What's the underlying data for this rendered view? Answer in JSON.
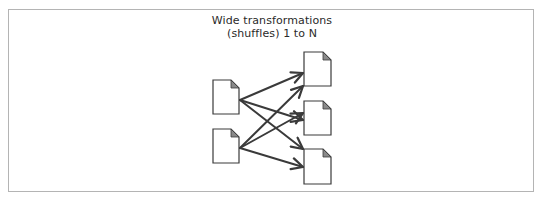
{
  "diagram": {
    "title_lines": [
      "Wide transformations",
      "(shuffles) 1 to N"
    ],
    "colors": {
      "frame": "#b4b4b4",
      "stroke": "#3a3a3a",
      "text": "#2a2a2a",
      "fold": "#8a8a8a",
      "document_fill": "#ffffff"
    },
    "source_partitions": [
      {
        "id": "src-1",
        "label": ""
      },
      {
        "id": "src-2",
        "label": ""
      }
    ],
    "target_partitions": [
      {
        "id": "dst-1",
        "label": ""
      },
      {
        "id": "dst-2",
        "label": ""
      },
      {
        "id": "dst-3",
        "label": ""
      }
    ],
    "edges": [
      {
        "from": "src-1",
        "to": "dst-1"
      },
      {
        "from": "src-1",
        "to": "dst-2"
      },
      {
        "from": "src-1",
        "to": "dst-3"
      },
      {
        "from": "src-2",
        "to": "dst-1"
      },
      {
        "from": "src-2",
        "to": "dst-2"
      },
      {
        "from": "src-2",
        "to": "dst-3"
      }
    ]
  }
}
